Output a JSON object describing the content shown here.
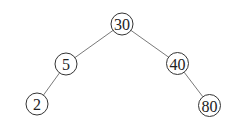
{
  "diagram": {
    "type": "binary-tree",
    "nodes": [
      {
        "id": "n30",
        "label": "30",
        "x": 122,
        "y": 24,
        "r": 11
      },
      {
        "id": "n5",
        "label": "5",
        "x": 66,
        "y": 64,
        "r": 11
      },
      {
        "id": "n40",
        "label": "40",
        "x": 177.5,
        "y": 63.5,
        "r": 11
      },
      {
        "id": "n2",
        "label": "2",
        "x": 37,
        "y": 104,
        "r": 11
      },
      {
        "id": "n80",
        "label": "80",
        "x": 209.5,
        "y": 105.5,
        "r": 11
      }
    ],
    "edges": [
      {
        "from": "n30",
        "to": "n5"
      },
      {
        "from": "n30",
        "to": "n40"
      },
      {
        "from": "n5",
        "to": "n2"
      },
      {
        "from": "n40",
        "to": "n80"
      }
    ]
  }
}
